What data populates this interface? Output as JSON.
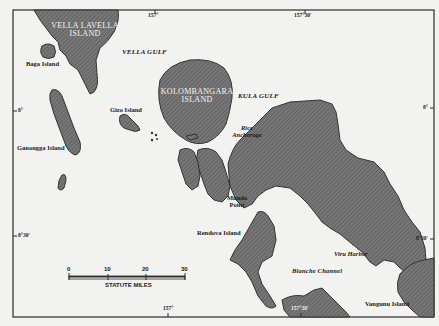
{
  "map": {
    "title": "Central Solomons — New Georgia area",
    "colors": {
      "land": "#6e6e6e",
      "land_dark": "#4a4a4a",
      "water": "#f2f2f0",
      "frame": "#2a2a2a"
    },
    "islands": [
      {
        "id": "vella-lavella",
        "label_line1": "VELLA LAVELLA",
        "label_line2": "ISLAND"
      },
      {
        "id": "kolombangara",
        "label_line1": "KOLOMBANGARA",
        "label_line2": "ISLAND"
      },
      {
        "id": "baga",
        "label": "Baga Island"
      },
      {
        "id": "gizo",
        "label": "Gizo Island"
      },
      {
        "id": "ganongga",
        "label": "Ganongga Island"
      },
      {
        "id": "rendova",
        "label": "Rendova Island"
      },
      {
        "id": "vangunu",
        "label": "Vangunu Island"
      }
    ],
    "waters": [
      {
        "id": "vella-gulf",
        "label": "VELLA GULF"
      },
      {
        "id": "kula-gulf",
        "label": "KULA GULF"
      },
      {
        "id": "blanche-channel",
        "label": "Blanche Channel"
      }
    ],
    "places": [
      {
        "id": "rice-anchorage",
        "label_line1": "Rice",
        "label_line2": "Anchorage"
      },
      {
        "id": "munda-point",
        "label_line1": "Munda",
        "label_line2": "Point"
      },
      {
        "id": "viru-harbor",
        "label": "Viru Harbor"
      }
    ],
    "coordinates": {
      "top_157": "157°",
      "top_157_30": "157°30'",
      "left_8": "8°",
      "right_8": "8°",
      "left_8_30": "8°30'",
      "right_8_30": "8°30'",
      "bottom_157": "157°",
      "bottom_157_30": "157°30'"
    },
    "scale": {
      "ticks": [
        "0",
        "10",
        "20",
        "30"
      ],
      "unit_label": "STATUTE MILES"
    }
  }
}
